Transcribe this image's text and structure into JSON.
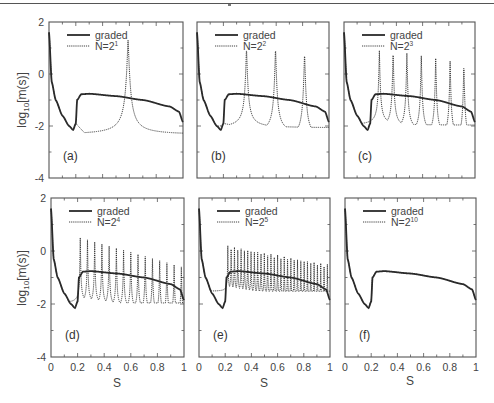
{
  "figure": {
    "ylabel": "log10[m(s)]",
    "ylabel_main": "log",
    "ylabel_sub": "10",
    "ylabel_tail": "[m(s)]",
    "xlabel": "S"
  },
  "chart_data": [
    {
      "type": "line",
      "panel": "(a)",
      "title": "",
      "xlabel": "",
      "ylabel": "log10[m(s)]",
      "xlim": [
        0,
        1
      ],
      "ylim": [
        -4,
        2
      ],
      "yticks": [
        -4,
        -2,
        0,
        2
      ],
      "xticks": [],
      "grid": false,
      "legend_position": "upper left",
      "series": [
        {
          "name": "graded",
          "style": "solid"
        },
        {
          "name": "N=2^1",
          "legend": "N=2",
          "exponent": "1",
          "style": "dotted",
          "num_peaks": 1,
          "peak_positions": [
            0.59
          ],
          "peak_values": [
            1.3
          ]
        }
      ]
    },
    {
      "type": "line",
      "panel": "(b)",
      "xlim": [
        0,
        1
      ],
      "ylim": [
        -4,
        2
      ],
      "grid": false,
      "series": [
        {
          "name": "graded",
          "style": "solid"
        },
        {
          "name": "N=2^2",
          "legend": "N=2",
          "exponent": "2",
          "style": "dotted",
          "num_peaks": 3,
          "peak_positions": [
            0.375,
            0.595,
            0.815
          ],
          "peak_values": [
            1.0,
            1.0,
            0.8
          ]
        }
      ]
    },
    {
      "type": "line",
      "panel": "(c)",
      "xlim": [
        0,
        1
      ],
      "ylim": [
        -4,
        2
      ],
      "grid": false,
      "series": [
        {
          "name": "graded",
          "style": "solid"
        },
        {
          "name": "N=2^3",
          "legend": "N=2",
          "exponent": "3",
          "style": "dotted",
          "num_peaks": 7,
          "peak_positions": [
            0.27,
            0.375,
            0.48,
            0.59,
            0.7,
            0.81,
            0.915
          ],
          "peak_values": [
            0.9,
            0.9,
            0.8,
            0.7,
            0.6,
            0.5,
            0.4
          ]
        }
      ]
    },
    {
      "type": "line",
      "panel": "(d)",
      "xlim": [
        0,
        1
      ],
      "ylim": [
        -4,
        2
      ],
      "xticks": [
        0,
        0.2,
        0.4,
        0.6,
        0.8,
        1
      ],
      "grid": false,
      "series": [
        {
          "name": "graded",
          "style": "solid"
        },
        {
          "name": "N=2^4",
          "legend": "N=2",
          "exponent": "4",
          "style": "dotted",
          "num_peaks": 15,
          "peak_top_start": 0.5,
          "peak_top_end": -0.6
        }
      ]
    },
    {
      "type": "line",
      "panel": "(e)",
      "xlim": [
        0,
        1
      ],
      "ylim": [
        -4,
        2
      ],
      "xticks": [
        0,
        0.2,
        0.4,
        0.6,
        0.8,
        1
      ],
      "grid": false,
      "series": [
        {
          "name": "graded",
          "style": "solid"
        },
        {
          "name": "N=2^5",
          "legend": "N=2",
          "exponent": "5",
          "style": "dotted",
          "num_peaks": 31,
          "peak_top_start": 0.2,
          "peak_top_end": -0.5
        }
      ]
    },
    {
      "type": "line",
      "panel": "(f)",
      "xlim": [
        0,
        1
      ],
      "ylim": [
        -4,
        2
      ],
      "xticks": [
        0,
        0.2,
        0.4,
        0.6,
        0.8,
        1
      ],
      "grid": false,
      "series": [
        {
          "name": "graded",
          "style": "solid"
        },
        {
          "name": "N=2^10",
          "legend": "N=2",
          "exponent": "10",
          "style": "dotted",
          "overlaps_graded": true
        }
      ]
    }
  ],
  "graded_curve": {
    "points": [
      [
        0.0,
        1.6
      ],
      [
        0.02,
        -0.3
      ],
      [
        0.05,
        -1.0
      ],
      [
        0.1,
        -1.6
      ],
      [
        0.15,
        -2.0
      ],
      [
        0.18,
        -2.15
      ],
      [
        0.2,
        -1.9
      ],
      [
        0.21,
        -1.0
      ],
      [
        0.24,
        -0.78
      ],
      [
        0.3,
        -0.76
      ],
      [
        0.5,
        -0.85
      ],
      [
        0.7,
        -1.0
      ],
      [
        0.9,
        -1.25
      ],
      [
        0.97,
        -1.45
      ],
      [
        1.0,
        -1.85
      ]
    ]
  },
  "axes": {
    "ytick_labels": [
      "2",
      "0",
      "-2",
      "-4"
    ],
    "xtick_labels": [
      "0",
      "0.2",
      "0.4",
      "0.6",
      "0.8",
      "1"
    ]
  },
  "panels": [
    {
      "id": "a",
      "label": "(a)",
      "legend_graded": "graded",
      "legend_n": "N=2",
      "legend_exp": "1"
    },
    {
      "id": "b",
      "label": "(b)",
      "legend_graded": "graded",
      "legend_n": "N=2",
      "legend_exp": "2"
    },
    {
      "id": "c",
      "label": "(c)",
      "legend_graded": "graded",
      "legend_n": "N=2",
      "legend_exp": "3"
    },
    {
      "id": "d",
      "label": "(d)",
      "legend_graded": "graded",
      "legend_n": "N=2",
      "legend_exp": "4"
    },
    {
      "id": "e",
      "label": "(e)",
      "legend_graded": "graded",
      "legend_n": "N=2",
      "legend_exp": "5"
    },
    {
      "id": "f",
      "label": "(f)",
      "legend_graded": "graded",
      "legend_n": "N=2",
      "legend_exp": "10"
    }
  ],
  "colors": {
    "line": "#2a2a2a",
    "axis": "#555555",
    "text": "#444444"
  }
}
